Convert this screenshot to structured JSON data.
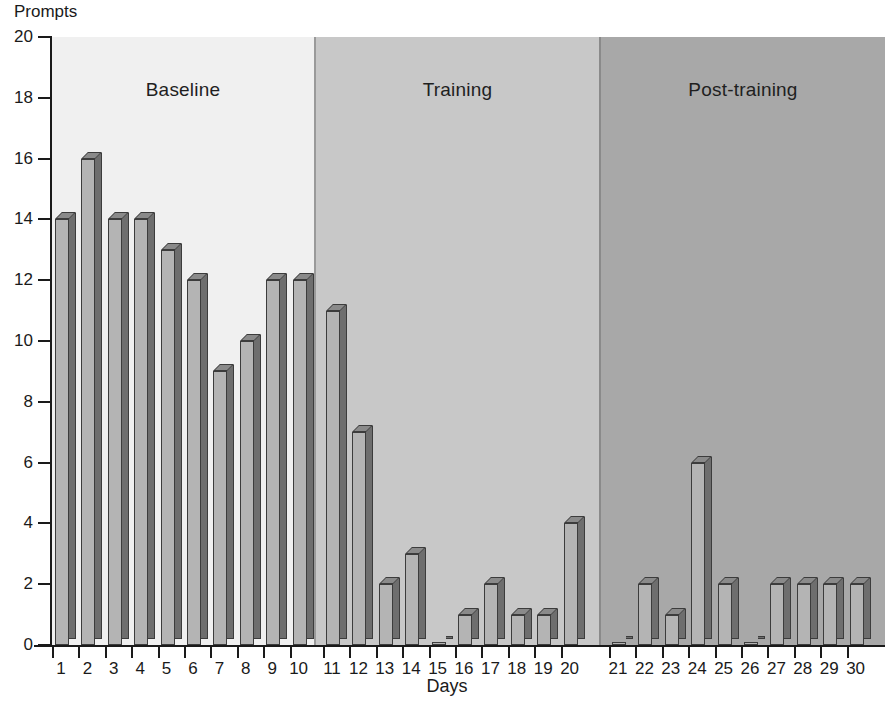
{
  "chart_data": {
    "type": "bar",
    "title": "",
    "ylabel": "Prompts",
    "xlabel": "Days",
    "ylim": [
      0,
      20
    ],
    "yticks": [
      0,
      2,
      4,
      6,
      8,
      10,
      12,
      14,
      16,
      18,
      20
    ],
    "grid": false,
    "legend": "none",
    "categories": [
      "1",
      "2",
      "3",
      "4",
      "5",
      "6",
      "7",
      "8",
      "9",
      "10",
      "11",
      "12",
      "13",
      "14",
      "15",
      "16",
      "17",
      "18",
      "19",
      "20",
      "21",
      "22",
      "23",
      "24",
      "25",
      "26",
      "27",
      "28",
      "29",
      "30"
    ],
    "values": [
      14,
      16,
      14,
      14,
      13,
      12,
      9,
      10,
      12,
      12,
      11,
      7,
      2,
      3,
      0,
      1,
      2,
      1,
      1,
      4,
      0,
      2,
      1,
      6,
      2,
      0,
      2,
      2,
      2,
      2
    ],
    "phases": [
      {
        "label": "Baseline",
        "days": [
          "1",
          "10"
        ],
        "values": [
          14,
          16,
          14,
          14,
          13,
          12,
          9,
          10,
          12,
          12
        ],
        "fill": "#f0f0f0"
      },
      {
        "label": "Training",
        "days": [
          "11",
          "20"
        ],
        "values": [
          11,
          7,
          2,
          3,
          0,
          1,
          2,
          1,
          1,
          4
        ],
        "fill": "#c8c8c8"
      },
      {
        "label": "Post-training",
        "days": [
          "21",
          "30"
        ],
        "values": [
          0,
          2,
          1,
          6,
          2,
          0,
          2,
          2,
          2,
          2
        ],
        "fill": "#a8a8a8"
      }
    ],
    "bar_front_color": "#b4b4b4",
    "bar_side_color": "#6e6e6e",
    "bar_top_color": "#8a8a8a",
    "bar_edge_color": "#3c3c3c"
  },
  "axes": {
    "y_title": "Prompts",
    "x_title": "Days"
  },
  "caption": {
    "text": ""
  }
}
